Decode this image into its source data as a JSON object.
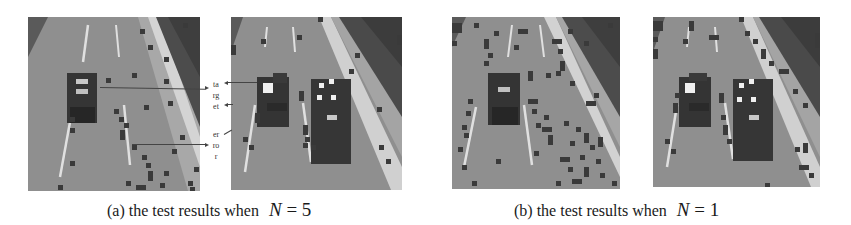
{
  "figure": {
    "subfigures": [
      {
        "id": "a",
        "caption_prefix": "(a) the test results when",
        "equation_var": "N",
        "equation_op": "=",
        "equation_val": "5",
        "images": [
          {
            "label": "single-car-road-n5",
            "scene": "one dark car on multi-lane road"
          },
          {
            "label": "two-vehicles-road-n5",
            "scene": "car and truck on multi-lane road"
          }
        ],
        "annotations": {
          "target": [
            "ta",
            "rg",
            "et"
          ],
          "error": [
            "er",
            "ro",
            "r"
          ]
        }
      },
      {
        "id": "b",
        "caption_prefix": "(b) the test results when",
        "equation_var": "N",
        "equation_op": "=",
        "equation_val": "1",
        "images": [
          {
            "label": "single-car-road-n1",
            "scene": "one dark car on multi-lane road"
          },
          {
            "label": "two-vehicles-road-n1",
            "scene": "car and truck on multi-lane road"
          }
        ]
      }
    ],
    "colors": {
      "road": "#8e8e8e",
      "road_dark": "#7a7a7a",
      "lane_marking": "#e6e6e6",
      "vegetation": "#4a4a4a",
      "patch": "#3a3a3a",
      "vehicle": "#333333",
      "highlight": "#f0f0f0"
    }
  }
}
